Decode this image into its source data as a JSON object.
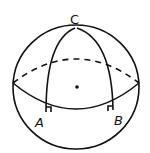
{
  "diagram": {
    "type": "sphere-geometry",
    "labels": {
      "top": "C",
      "left": "A",
      "right": "B"
    },
    "colors": {
      "stroke": "#111111",
      "background": "#ffffff"
    }
  }
}
